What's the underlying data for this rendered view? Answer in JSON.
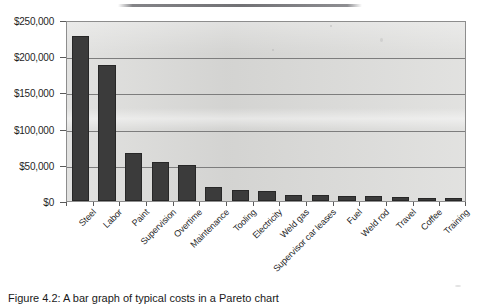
{
  "figure": {
    "caption": "Figure 4.2: A bar graph of typical costs in a Pareto chart",
    "artifact_name": "scan-line-artifact"
  },
  "chart_data": {
    "type": "bar",
    "title": "",
    "xlabel": "",
    "ylabel": "",
    "ylim": [
      0,
      250000
    ],
    "grid": true,
    "legend": "none",
    "y_ticks": [
      "$0",
      "$50,000",
      "$100,000",
      "$150,000",
      "$200,000",
      "$250,000"
    ],
    "y_tick_values": [
      0,
      50000,
      100000,
      150000,
      200000,
      250000
    ],
    "categories": [
      "Steel",
      "Labor",
      "Paint",
      "Supervision",
      "Overtime",
      "Maintenance",
      "Tooling",
      "Electricity",
      "Weld gas",
      "Supervisor car leases",
      "Fuel",
      "Weld rod",
      "Travel",
      "Coffee",
      "Training"
    ],
    "values": [
      228000,
      188000,
      67000,
      54000,
      50000,
      19500,
      15000,
      14000,
      8000,
      8000,
      7500,
      7000,
      5500,
      4500,
      4000
    ],
    "bar_color": "#3b3b3b",
    "plot_background": "#dcdcda",
    "gridline_color": "#7d7d7d"
  }
}
